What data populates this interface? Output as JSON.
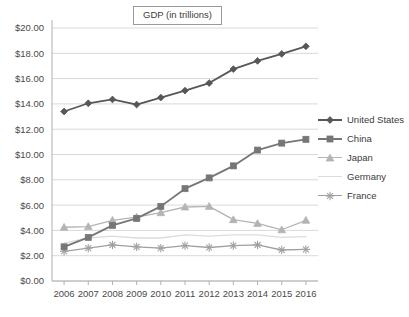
{
  "chart_data": {
    "type": "line",
    "title": "GDP (in trillions)",
    "xlabel": "",
    "ylabel": "",
    "grid": true,
    "legend_position": "right",
    "ylim": [
      0,
      20
    ],
    "ytick_step": 2,
    "ytick_labels": [
      "$0.00",
      "$2.00",
      "$4.00",
      "$6.00",
      "$8.00",
      "$10.00",
      "$12.00",
      "$14.00",
      "$16.00",
      "$18.00",
      "$20.00"
    ],
    "ytick_values": [
      0,
      2,
      4,
      6,
      8,
      10,
      12,
      14,
      16,
      18,
      20
    ],
    "categories": [
      "2006",
      "2007",
      "2008",
      "2009",
      "2010",
      "2011",
      "2012",
      "2013",
      "2014",
      "2015",
      "2016"
    ],
    "x": [
      2006,
      2007,
      2008,
      2009,
      2010,
      2011,
      2012,
      2013,
      2014,
      2015,
      2016
    ],
    "series": [
      {
        "name": "United States",
        "marker": "diamond",
        "color": "#575757",
        "values": [
          13.4,
          14.05,
          14.35,
          13.95,
          14.5,
          15.05,
          15.65,
          16.75,
          17.4,
          17.95,
          18.55
        ]
      },
      {
        "name": "China",
        "marker": "square",
        "color": "#767676",
        "values": [
          2.7,
          3.45,
          4.4,
          4.95,
          5.9,
          7.3,
          8.15,
          9.1,
          10.35,
          10.9,
          11.2
        ]
      },
      {
        "name": "Japan",
        "marker": "triangle",
        "color": "#b4b4b4",
        "values": [
          4.25,
          4.3,
          4.8,
          5.05,
          5.4,
          5.85,
          5.9,
          4.85,
          4.55,
          4.05,
          4.8
        ]
      },
      {
        "name": "Germany",
        "marker": "none",
        "color": "#dcdcdc",
        "values": [
          3.0,
          3.4,
          3.55,
          3.4,
          3.4,
          3.65,
          3.55,
          3.65,
          3.65,
          3.45,
          3.5
        ]
      },
      {
        "name": "France",
        "marker": "asterisk",
        "color": "#a0a0a0",
        "values": [
          2.35,
          2.6,
          2.85,
          2.7,
          2.6,
          2.8,
          2.65,
          2.8,
          2.85,
          2.45,
          2.5
        ]
      }
    ]
  },
  "colors": {
    "gridline": "#d9d9d9",
    "axis": "#b0b0b0",
    "text": "#3c3c3c",
    "background": "#ffffff"
  }
}
